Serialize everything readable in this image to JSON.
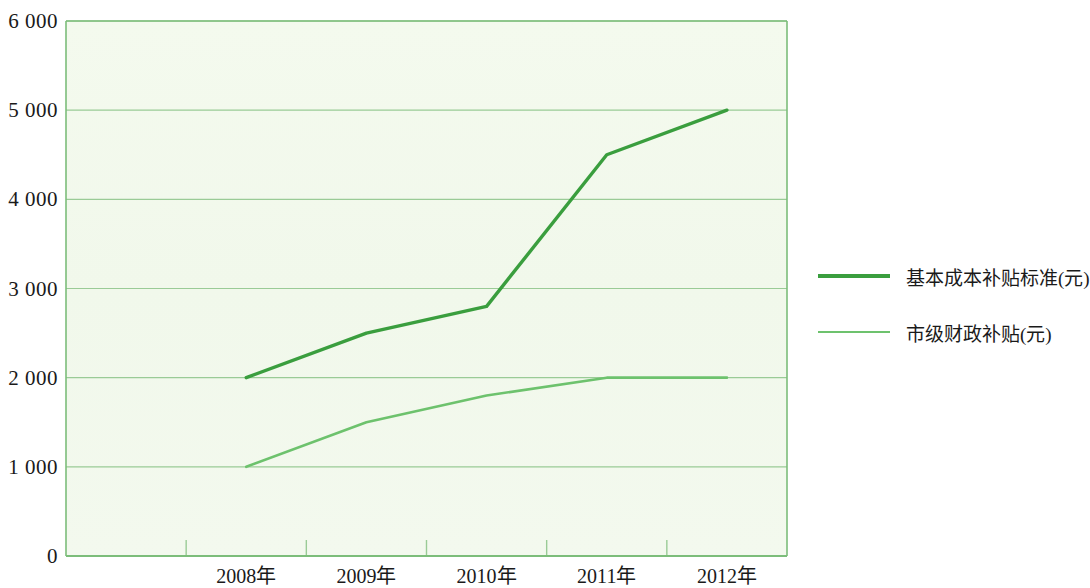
{
  "chart_data": {
    "type": "line",
    "title": "",
    "xlabel": "",
    "ylabel": "",
    "categories": [
      "2008年",
      "2009年",
      "2010年",
      "2011年",
      "2012年"
    ],
    "ylim": [
      0,
      6000
    ],
    "y_ticks": [
      "0",
      "1 000",
      "2 000",
      "3 000",
      "4 000",
      "5 000",
      "6 000"
    ],
    "y_tick_values": [
      0,
      1000,
      2000,
      3000,
      4000,
      5000,
      6000
    ],
    "grid": true,
    "legend_position": "right",
    "series": [
      {
        "name": "基本成本补贴标准(元)",
        "color": "#3a9e3e",
        "values": [
          2000,
          2500,
          2800,
          4500,
          5000
        ]
      },
      {
        "name": "市级财政补贴(元)",
        "color": "#6dc26d",
        "values": [
          1000,
          1500,
          1800,
          2000,
          2000
        ]
      }
    ]
  },
  "legend": {
    "items": [
      {
        "label": "基本成本补贴标准(元)"
      },
      {
        "label": "市级财政补贴(元)"
      }
    ]
  },
  "colors": {
    "series_primary": "#3a9e3e",
    "series_secondary": "#6dc26d",
    "grid": "#9acb96",
    "axis": "#7cbd7a",
    "plot_background": "#f2f8ec"
  }
}
